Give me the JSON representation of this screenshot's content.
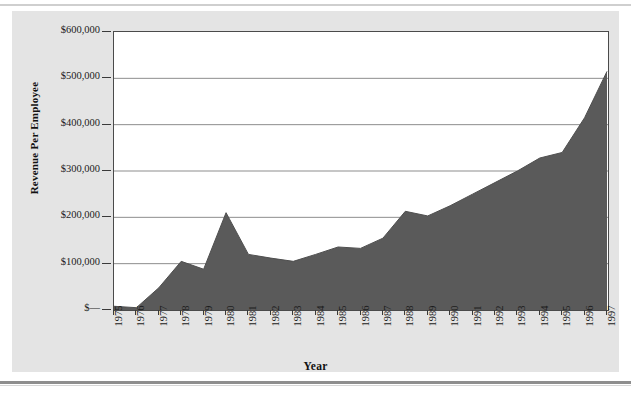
{
  "chart_data": {
    "type": "area",
    "title": "",
    "xlabel": "Year",
    "ylabel": "Revenue Per Employee",
    "categories": [
      "1975",
      "1976",
      "1977",
      "1978",
      "1979",
      "1980",
      "1981",
      "1982",
      "1983",
      "1984",
      "1985",
      "1986",
      "1987",
      "1988",
      "1989",
      "1990",
      "1991",
      "1992",
      "1993",
      "1994",
      "1995",
      "1996",
      "1997"
    ],
    "values": [
      8000,
      5000,
      48000,
      105000,
      88000,
      210000,
      120000,
      112000,
      105000,
      120000,
      136000,
      133000,
      155000,
      213000,
      203000,
      225000,
      250000,
      275000,
      300000,
      328000,
      340000,
      415000,
      515000
    ],
    "ylim": [
      0,
      600000
    ],
    "ytick_labels": [
      "$600,000",
      "$500,000",
      "$400,000",
      "$300,000",
      "$200,000",
      "$100,000",
      "$—"
    ],
    "ytick_values": [
      600000,
      500000,
      400000,
      300000,
      200000,
      100000,
      0
    ],
    "grid": true,
    "legend": false,
    "series_color": "#5a5a5a",
    "grid_color": "#8d8d8d",
    "axis_color": "#4a4a4a",
    "plot_background": "#ffffff",
    "figure_background": "#e4e4e4"
  }
}
